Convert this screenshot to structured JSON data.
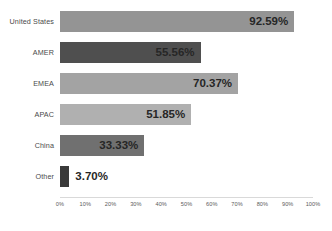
{
  "chart_data": {
    "type": "bar",
    "orientation": "horizontal",
    "title": "",
    "xlabel": "",
    "ylabel": "",
    "xlim": [
      0,
      100
    ],
    "grid": false,
    "legend": "none",
    "categories": [
      "United States",
      "AMER",
      "EMEA",
      "APAC",
      "China",
      "Other"
    ],
    "values": [
      92.59,
      55.56,
      70.37,
      51.85,
      33.33,
      3.7
    ],
    "value_labels": [
      "92.59%",
      "55.56%",
      "70.37%",
      "51.85%",
      "33.33%",
      "3.70%"
    ],
    "bar_colors": [
      "#949494",
      "#4f4f4f",
      "#a3a3a3",
      "#b0b0b0",
      "#707070",
      "#3a3a3a"
    ],
    "label_placement": [
      "inside",
      "inside",
      "inside",
      "inside",
      "inside",
      "outside"
    ],
    "xticks": [
      0,
      10,
      20,
      30,
      40,
      50,
      60,
      70,
      80,
      90,
      100
    ],
    "xtick_labels": [
      "0%",
      "10%",
      "20%",
      "30%",
      "40%",
      "50%",
      "60%",
      "70%",
      "80%",
      "90%",
      "100%"
    ]
  },
  "style": {
    "background": "#ffffff",
    "axis_line_color": "#d9d9d9",
    "category_label_color": "#4a4a4a",
    "value_label_color": "#262626",
    "tick_label_color": "#5a5a5a"
  }
}
